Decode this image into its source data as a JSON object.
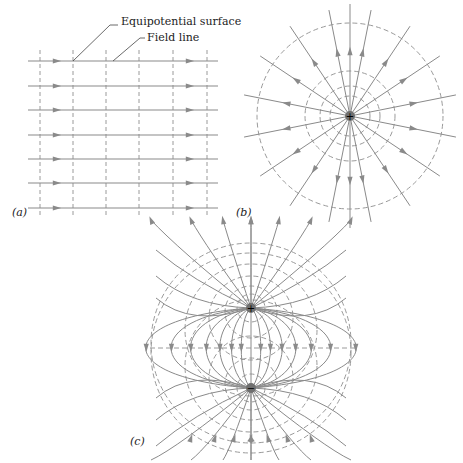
{
  "annotations": {
    "equipotential_surface": "Equipotential surface",
    "field_line": "Field line"
  },
  "panels": {
    "a": {
      "label": "(a)",
      "description": "Uniform electric field"
    },
    "b": {
      "label": "(b)",
      "description": "Field of a point positive charge",
      "charge": "+"
    },
    "c": {
      "label": "(c)",
      "description": "Electric dipole",
      "charges": [
        "+",
        "−"
      ]
    }
  },
  "colors": {
    "field_line": "#8a8a8a",
    "equipotential": "#9a9a9a",
    "text": "#222222",
    "charge_fill": "#6f6f6f"
  }
}
